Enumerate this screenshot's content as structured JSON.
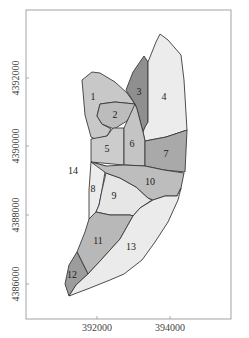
{
  "map": {
    "frame": {
      "x": 26,
      "y": 10,
      "width": 205,
      "height": 309
    },
    "x_axis": {
      "ticks": [
        {
          "label": "392000",
          "x": 97
        },
        {
          "label": "394000",
          "x": 170
        }
      ]
    },
    "y_axis": {
      "ticks": [
        {
          "label": "4392000",
          "y": 78
        },
        {
          "label": "4390000",
          "y": 146
        },
        {
          "label": "4388000",
          "y": 215
        },
        {
          "label": "4386000",
          "y": 284
        }
      ]
    },
    "zones": [
      {
        "id": "1",
        "label": "1",
        "fill": "#c8c8c8",
        "label_x": 93,
        "label_y": 98,
        "points": "82,80 92,72 100,73 115,82 127,93 135,104 115,102 100,104 97,116 102,124 111,129 107,136 95,139 91,137 85,115"
      },
      {
        "id": "2",
        "label": "2",
        "fill": "#bcbcbc",
        "label_x": 115,
        "label_y": 116,
        "points": "100,104 115,102 135,104 134,110 127,121 114,129 102,124 97,116"
      },
      {
        "id": "3",
        "label": "3",
        "fill": "#8f8f8f",
        "label_x": 139,
        "label_y": 93,
        "points": "126,90 133,72 144,56 148,62 148,122 145,127 143,132 137,109 135,104"
      },
      {
        "id": "4",
        "label": "4",
        "fill": "#ececec",
        "label_x": 164,
        "label_y": 98,
        "points": "148,62 156,42 160,34 168,40 181,55 184,80 187,130 166,137 145,141 143,132 145,127 148,122"
      },
      {
        "id": "5",
        "label": "5",
        "fill": "#cccccc",
        "label_x": 107,
        "label_y": 150,
        "points": "91,139 107,136 113,128 124,128 124,165 91,162"
      },
      {
        "id": "6",
        "label": "6",
        "fill": "#c4c4c4",
        "label_x": 132,
        "label_y": 145,
        "points": "124,128 135,104 137,109 143,132 145,141 145,166 124,165"
      },
      {
        "id": "7",
        "label": "7",
        "fill": "#a9a9a9",
        "label_x": 166,
        "label_y": 155,
        "points": "145,141 166,137 187,130 185,172 164,170 145,166"
      },
      {
        "id": "8",
        "label": "8",
        "fill": "#ececec",
        "label_x": 93,
        "label_y": 190,
        "points": "91,162 106,166 102,190 99,205 96,212 89,219 89,190"
      },
      {
        "id": "9",
        "label": "9",
        "fill": "#e6e6e6",
        "label_x": 114,
        "label_y": 197,
        "points": "106,173 120,178 136,187 148,198 152,200 140,208 133,216 130,215 110,215 96,212 99,205 102,190"
      },
      {
        "id": "10",
        "label": "10",
        "fill": "#bdbdbd",
        "label_x": 150,
        "label_y": 183,
        "points": "91,162 106,166 124,165 145,166 164,170 184,173 181,188 177,196 165,196 153,200 148,198 136,187 120,178 106,173"
      },
      {
        "id": "11",
        "label": "11",
        "fill": "#b8b8b8",
        "label_x": 98,
        "label_y": 242,
        "points": "89,219 96,212 110,215 130,215 133,216 120,239 101,260 88,274 77,252 85,232"
      },
      {
        "id": "12",
        "label": "12",
        "fill": "#9c9c9c",
        "label_x": 72,
        "label_y": 276,
        "points": "77,252 88,274 76,285 69,296 65,284 69,265"
      },
      {
        "id": "13",
        "label": "13",
        "fill": "#ebebeb",
        "label_x": 131,
        "label_y": 248,
        "points": "133,216 140,208 153,200 165,196 177,196 181,188 178,200 168,222 155,242 142,260 124,274 110,280 90,288 69,296 76,285 88,274 101,260 120,239"
      },
      {
        "id": "14",
        "label": "14",
        "fill": "none",
        "label_x": 73,
        "label_y": 172,
        "points": ""
      }
    ]
  }
}
